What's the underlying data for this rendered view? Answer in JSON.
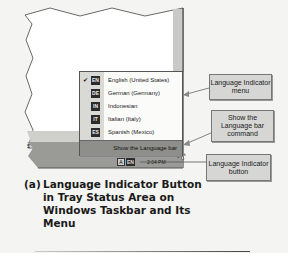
{
  "figure": {
    "label": "(a)",
    "caption_lines": [
      "Language Indicator Button",
      "in Tray Status Area on",
      "Windows Taskbar and Its",
      "Menu"
    ]
  },
  "language_menu": {
    "items": [
      {
        "code": "EN",
        "label": "English (United States)",
        "checked": true
      },
      {
        "code": "DE",
        "label": "German (Germany)",
        "checked": false
      },
      {
        "code": "IN",
        "label": "Indonesian",
        "checked": false
      },
      {
        "code": "IT",
        "label": "Italian (Italy)",
        "checked": false
      },
      {
        "code": "ES",
        "label": "Spanish (Mexico)",
        "checked": false
      }
    ],
    "check_glyph": "✔",
    "command": "Show the Language bar"
  },
  "taskbar": {
    "left_text": "5",
    "tray_icon_code": "EN",
    "tray_helper_glyph": "A",
    "clock": "2:04 PM"
  },
  "callouts": {
    "menu": "Language Indicator menu",
    "command": "Show the Language bar command",
    "button": "Language Indicator button"
  },
  "colors": {
    "background": "#f4f4f2",
    "menu_bg": "#fbfbfa",
    "menu_gutter": "#d9d9d6",
    "command_bg": "#8e8e8b",
    "badge_bg": "#2b2b2b",
    "callout_bg": "#d6d6d4",
    "taskbar": "#9a9a97"
  }
}
